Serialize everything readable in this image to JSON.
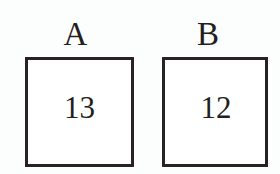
{
  "diagram": {
    "type": "two-labeled-squares",
    "background_color": "#fcfdfd",
    "stroke_color": "#262322",
    "text_color": "#231f1e",
    "boxes": [
      {
        "label": "A",
        "value": "13"
      },
      {
        "label": "B",
        "value": "12"
      }
    ]
  }
}
